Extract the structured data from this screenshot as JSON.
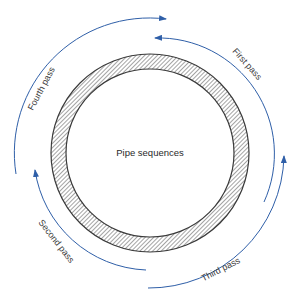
{
  "diagram": {
    "center_label": "Pipe sequences",
    "passes": [
      {
        "id": "first",
        "label": "First pass"
      },
      {
        "id": "second",
        "label": "Second pass"
      },
      {
        "id": "third",
        "label": "Third pass"
      },
      {
        "id": "fourth",
        "label": "Fourth pass"
      }
    ],
    "colors": {
      "arrow": "#2f5fa8",
      "ring_stroke": "#3a3a3a",
      "hatch": "#4a4a4a"
    }
  }
}
